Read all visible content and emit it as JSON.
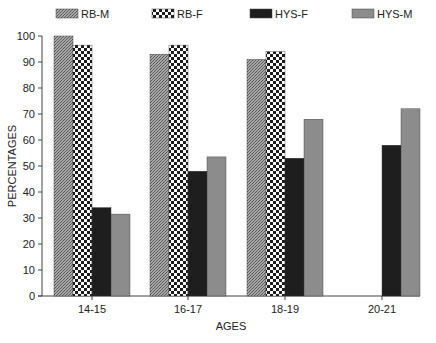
{
  "chart_data": {
    "type": "bar",
    "title": "",
    "xlabel": "AGES",
    "ylabel": "PERCENTAGES",
    "ylim": [
      0,
      100
    ],
    "yticks": [
      0,
      10,
      20,
      30,
      40,
      50,
      60,
      70,
      80,
      90,
      100
    ],
    "grid": false,
    "legend_position": "top",
    "categories": [
      "14-15",
      "16-17",
      "18-19",
      "20-21"
    ],
    "series": [
      {
        "name": "RB-M",
        "pattern": "fine-crosshatch",
        "color": "#8a8a8a",
        "values": [
          100,
          93,
          91,
          null
        ]
      },
      {
        "name": "RB-F",
        "pattern": "checkerboard",
        "color": "#222222",
        "values": [
          96.5,
          96.5,
          94,
          null
        ]
      },
      {
        "name": "HYS-F",
        "pattern": "solid-dark",
        "color": "#1e1e1e",
        "values": [
          34,
          48,
          53,
          58
        ]
      },
      {
        "name": "HYS-M",
        "pattern": "solid-gray",
        "color": "#8c8c8c",
        "values": [
          31.5,
          53.5,
          68,
          72
        ]
      }
    ]
  }
}
